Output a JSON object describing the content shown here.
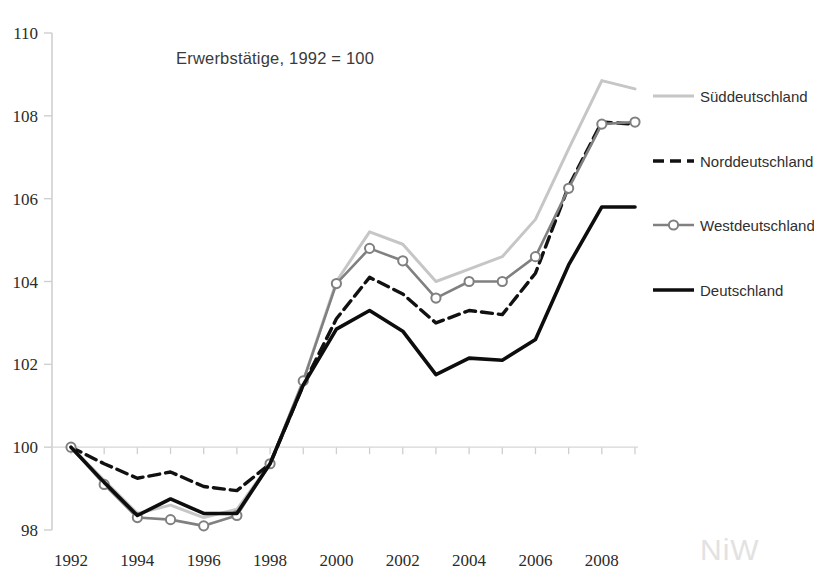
{
  "chart_data": {
    "type": "line",
    "title": "Erwerbstätige, 1992 =  100",
    "xlabel": "",
    "ylabel": "",
    "x": [
      1992,
      1993,
      1994,
      1995,
      1996,
      1997,
      1998,
      1999,
      2000,
      2001,
      2002,
      2003,
      2004,
      2005,
      2006,
      2007,
      2008,
      2009
    ],
    "xlim": [
      1992,
      2009
    ],
    "ylim": [
      98,
      110
    ],
    "yticks": [
      98,
      100,
      102,
      104,
      106,
      108,
      110
    ],
    "xticks": [
      1992,
      1994,
      1996,
      1998,
      2000,
      2002,
      2004,
      2006,
      2008
    ],
    "xtick_labels": [
      "1992",
      "1994",
      "1996",
      "1998",
      "2000",
      "2002",
      "2004",
      "2006",
      "2008"
    ],
    "ytick_labels": [
      "98",
      "100",
      "102",
      "104",
      "106",
      "108",
      "110"
    ],
    "grid": false,
    "baseline": 100,
    "legend_position": "right",
    "series": [
      {
        "name": "Süddeutschland",
        "color": "#c6c6c6",
        "style": "solid",
        "marker": "none",
        "width": 3,
        "values": [
          100.0,
          99.2,
          98.4,
          98.6,
          98.3,
          98.5,
          99.6,
          101.6,
          104.0,
          105.2,
          104.9,
          104.0,
          104.3,
          104.6,
          105.5,
          107.2,
          108.85,
          108.65
        ]
      },
      {
        "name": "Norddeutschland",
        "color": "#111111",
        "style": "dashed",
        "marker": "none",
        "width": 3.4,
        "values": [
          100.0,
          99.6,
          99.25,
          99.4,
          99.05,
          98.95,
          99.6,
          101.5,
          103.1,
          104.1,
          103.7,
          103.0,
          103.3,
          103.2,
          104.2,
          106.3,
          107.85,
          107.8
        ]
      },
      {
        "name": "Westdeutschland",
        "color": "#808080",
        "style": "solid",
        "marker": "circle",
        "width": 2.6,
        "values": [
          100.0,
          99.1,
          98.3,
          98.25,
          98.1,
          98.35,
          99.6,
          101.6,
          103.95,
          104.8,
          104.5,
          103.6,
          104.0,
          104.0,
          104.6,
          106.25,
          107.8,
          107.85
        ]
      },
      {
        "name": "Deutschland",
        "color": "#0d0d0d",
        "style": "solid",
        "marker": "none",
        "width": 3.6,
        "values": [
          100.0,
          99.15,
          98.35,
          98.75,
          98.4,
          98.4,
          99.6,
          101.5,
          102.85,
          103.3,
          102.8,
          101.75,
          102.15,
          102.1,
          102.6,
          104.4,
          105.8,
          105.8
        ]
      }
    ]
  },
  "watermark": {
    "text": "NiW"
  },
  "axis": {
    "line_color": "#d0d0d0",
    "tick_color": "#cfcfcf"
  }
}
